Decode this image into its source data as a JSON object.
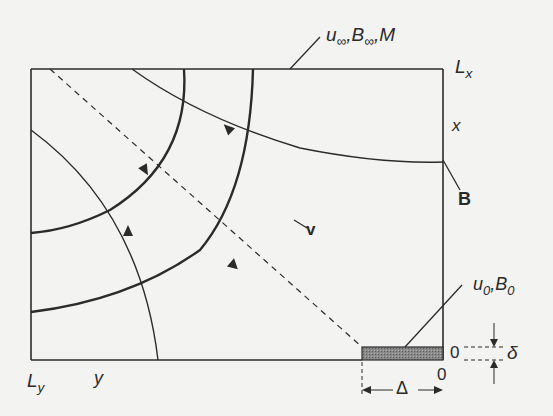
{
  "diagram": {
    "type": "boundary-layer flow schematic",
    "labels": {
      "inflow": "u∞, B∞, M",
      "inflow_parts": {
        "u": "u",
        "u_sub": "∞",
        "B": "B",
        "B_sub": "∞",
        "M": "M"
      },
      "Lx": {
        "main": "L",
        "sub": "x"
      },
      "x_axis": "x",
      "field_B": "B",
      "field_v": "v",
      "plate": {
        "u": "u",
        "u_sub": "0",
        "B": "B",
        "B_sub": "0"
      },
      "origin_x": "0",
      "origin_y": "0",
      "delta": "δ",
      "Delta": "Δ",
      "Ly": {
        "main": "L",
        "sub": "y"
      },
      "y_axis": "y"
    },
    "colors": {
      "line": "#2b2b2b",
      "plate_fill": "#7a7a7a",
      "background": "#f3f3f1"
    }
  }
}
